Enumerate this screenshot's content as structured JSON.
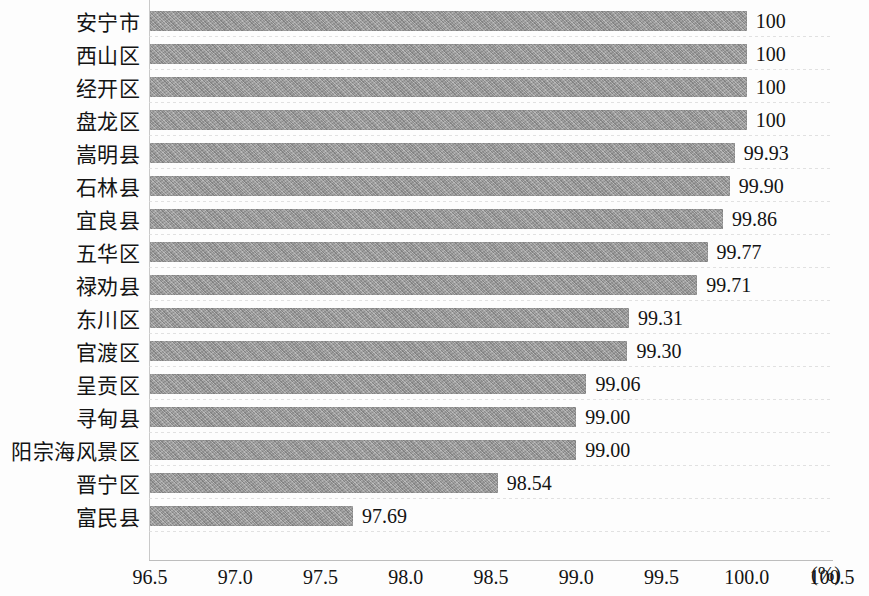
{
  "chart_data": {
    "type": "bar",
    "orientation": "horizontal",
    "title": "",
    "subtitle": "",
    "xlabel": "(%)",
    "ylabel": "",
    "xlim": [
      96.5,
      100.5
    ],
    "xticks": [
      "96.5",
      "97.0",
      "97.5",
      "98.0",
      "98.5",
      "99.0",
      "99.5",
      "100.0",
      "100.5"
    ],
    "xtick_values": [
      96.5,
      97.0,
      97.5,
      98.0,
      98.5,
      99.0,
      99.5,
      100.0,
      100.5
    ],
    "grid": "horizontal-dotted",
    "legend": "none",
    "bar_color": "#9a9a9a",
    "categories": [
      "安宁市",
      "西山区",
      "经开区",
      "盘龙区",
      "嵩明县",
      "石林县",
      "宜良县",
      "五华区",
      "禄劝县",
      "东川区",
      "官渡区",
      "呈贡区",
      "寻甸县",
      "阳宗海风景区",
      "晋宁区",
      "富民县"
    ],
    "values": [
      100,
      100,
      100,
      100,
      99.93,
      99.9,
      99.86,
      99.77,
      99.71,
      99.31,
      99.3,
      99.06,
      99.0,
      99.0,
      98.54,
      97.69
    ],
    "value_labels": [
      "100",
      "100",
      "100",
      "100",
      "99.93",
      "99.90",
      "99.86",
      "99.77",
      "99.71",
      "99.31",
      "99.30",
      "99.06",
      "99.00",
      "99.00",
      "98.54",
      "97.69"
    ]
  }
}
